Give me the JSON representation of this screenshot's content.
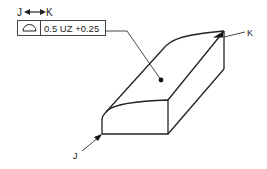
{
  "diagram": {
    "type": "GD&T profile of a surface callout",
    "between_indicator": {
      "from_label": "J",
      "to_label": "K",
      "symbol": "between-arrows"
    },
    "feature_control_frame": {
      "symbol": "profile-of-a-surface",
      "tolerance_text": "0.5 UZ +0.25"
    },
    "labels": {
      "point_j": "J",
      "point_k": "K"
    },
    "colors": {
      "line": "#222222",
      "frame_border": "#444444",
      "background": "#ffffff"
    }
  }
}
